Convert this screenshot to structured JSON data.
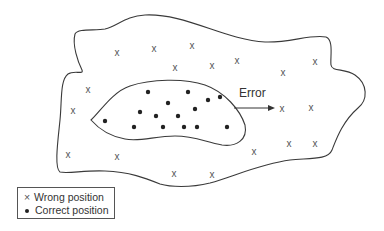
{
  "diagram": {
    "error_label": "Error",
    "legend": {
      "items": [
        {
          "symbol": "x",
          "label": "Wrong position"
        },
        {
          "symbol": "dot",
          "label": "Correct position"
        }
      ]
    },
    "wrong_positions": [
      [
        117,
        52
      ],
      [
        154,
        48
      ],
      [
        192,
        45
      ],
      [
        175,
        67
      ],
      [
        212,
        65
      ],
      [
        237,
        60
      ],
      [
        283,
        72
      ],
      [
        315,
        61
      ],
      [
        88,
        89
      ],
      [
        73,
        110
      ],
      [
        282,
        108
      ],
      [
        311,
        107
      ],
      [
        68,
        154
      ],
      [
        117,
        156
      ],
      [
        254,
        151
      ],
      [
        289,
        143
      ],
      [
        315,
        143
      ],
      [
        174,
        173
      ],
      [
        212,
        174
      ]
    ],
    "correct_positions": [
      [
        148,
        92
      ],
      [
        168,
        103
      ],
      [
        140,
        112
      ],
      [
        156,
        116
      ],
      [
        105,
        121
      ],
      [
        134,
        127
      ],
      [
        163,
        127
      ],
      [
        188,
        92
      ],
      [
        208,
        100
      ],
      [
        220,
        97
      ],
      [
        195,
        109
      ],
      [
        178,
        116
      ],
      [
        184,
        127
      ],
      [
        197,
        127
      ],
      [
        227,
        127
      ]
    ],
    "colors": {
      "stroke": "#3a3a3a",
      "cross": "#555555",
      "dot": "#222222",
      "background": "#ffffff"
    }
  }
}
